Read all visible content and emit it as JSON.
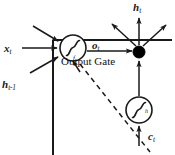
{
  "diagram": {
    "type": "neural-network-cell-diagram",
    "colors": {
      "stroke": "#1a1a1a",
      "fill_node": "#000000",
      "background": "#ffffff"
    },
    "labels": {
      "input_x": {
        "symbol": "x",
        "subscript": "t"
      },
      "input_h_prev": {
        "symbol": "h",
        "subscript": "t-1"
      },
      "gate_output": {
        "symbol": "o",
        "subscript": "t"
      },
      "cell_output": {
        "symbol": "h",
        "subscript": "t"
      },
      "cell_state": {
        "symbol": "c",
        "subscript": "t"
      },
      "gate_name": "Output Gate",
      "activation_gate": "f",
      "activation_cell": "h"
    },
    "nodes": [
      {
        "id": "output-gate-sigmoid",
        "kind": "sigmoid-circle",
        "label": "f",
        "cx": 73,
        "cy": 48,
        "r": 13
      },
      {
        "id": "multiplication-node",
        "kind": "filled-dot",
        "cx": 139,
        "cy": 52,
        "r": 6
      },
      {
        "id": "cell-activation-sigmoid",
        "kind": "sigmoid-circle",
        "label": "h",
        "cx": 139,
        "cy": 110,
        "r": 13
      }
    ],
    "edges": [
      {
        "id": "x-to-gate",
        "style": "solid-arrow",
        "from": "input_x",
        "to": "output-gate-sigmoid"
      },
      {
        "id": "h-prev-to-gate",
        "style": "solid-arrow",
        "from": "input_h_prev",
        "to": "output-gate-sigmoid"
      },
      {
        "id": "top-into-gate",
        "style": "solid-arrow",
        "from": "external",
        "to": "output-gate-sigmoid"
      },
      {
        "id": "bottom-into-gate",
        "style": "solid-arrow",
        "from": "external",
        "to": "output-gate-sigmoid"
      },
      {
        "id": "gate-to-mult",
        "style": "solid-arrow",
        "from": "output-gate-sigmoid",
        "to": "multiplication-node"
      },
      {
        "id": "c-to-cell-sigmoid",
        "style": "solid-arrow",
        "from": "cell_state",
        "to": "cell-activation-sigmoid"
      },
      {
        "id": "cell-sigmoid-to-mult",
        "style": "solid-arrow",
        "from": "cell-activation-sigmoid",
        "to": "multiplication-node"
      },
      {
        "id": "mult-to-h-out",
        "style": "solid-arrow",
        "from": "multiplication-node",
        "to": "cell_output"
      },
      {
        "id": "mult-fanout-left",
        "style": "solid-arrow",
        "from": "multiplication-node",
        "to": "external"
      },
      {
        "id": "mult-fanout-right",
        "style": "solid-arrow",
        "from": "multiplication-node",
        "to": "external"
      },
      {
        "id": "gate-recurrent-dashed",
        "style": "dashed-line",
        "from": "output-gate-sigmoid",
        "to": "external"
      }
    ]
  }
}
